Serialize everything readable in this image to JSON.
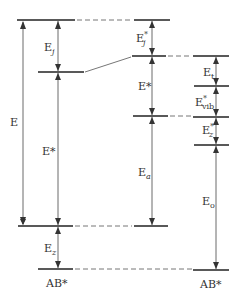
{
  "diagram": {
    "type": "energy-level-diagram",
    "labels": {
      "E": "E",
      "Ej": "E",
      "Ej_sub": "j",
      "Estar_left": "E*",
      "Ez": "E",
      "Ez_sub": "z",
      "AB_left": "AB*",
      "Ej_star": "E",
      "Ej_star_sup": "*",
      "Ej_star_sub": "j",
      "Estar_mid": "E*",
      "Ea": "E",
      "Ea_sub": "a",
      "Et": "E",
      "Et_sub": "t",
      "Evib": "E",
      "Evib_sup": "*",
      "Evib_sub": "vib",
      "Ez_star": "E",
      "Ez_star_sup": "*",
      "Ez_star_sub": "z",
      "E0": "E",
      "E0_sub": "o",
      "AB_right": "AB*"
    },
    "colors": {
      "line": "#222222",
      "dash": "#666666",
      "text": "#333333"
    }
  }
}
